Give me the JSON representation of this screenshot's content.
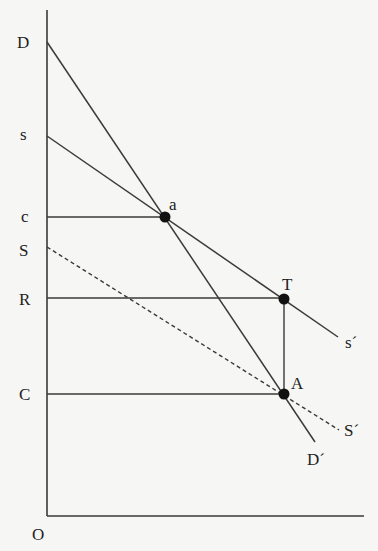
{
  "diagram": {
    "type": "economics-supply-demand",
    "colors": {
      "line": "#3a3a3a",
      "point": "#111111",
      "background": "#f6f6f4"
    },
    "axes": {
      "origin_label": "O",
      "y_axis_labels": [
        "D",
        "s",
        "c",
        "S",
        "R",
        "C"
      ]
    },
    "lines": [
      {
        "id": "demand",
        "from_label": "D",
        "to_label": "D´",
        "style": "solid"
      },
      {
        "id": "private-supply",
        "from_label": "s",
        "to_label": "s´",
        "style": "solid"
      },
      {
        "id": "social-supply",
        "from_label": "S",
        "to_label": "S´",
        "style": "dashed"
      }
    ],
    "points": [
      {
        "label": "a"
      },
      {
        "label": "T"
      },
      {
        "label": "A"
      }
    ],
    "labels": {
      "D": "D",
      "s": "s",
      "c": "c",
      "S": "S",
      "R": "R",
      "C": "C",
      "O": "O",
      "a": "a",
      "T": "T",
      "A": "A",
      "s_end": "s´",
      "S_end": "S´",
      "D_end": "D´"
    }
  }
}
